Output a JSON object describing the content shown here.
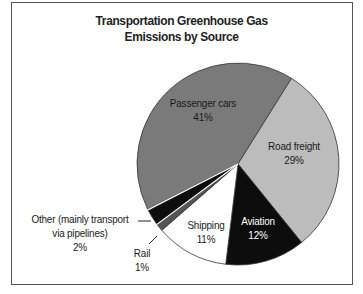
{
  "chart_data": {
    "type": "pie",
    "title": "Transportation Greenhouse Gas Emissions by Source",
    "title_lines": [
      "Transportation Greenhouse Gas",
      "Emissions by Source"
    ],
    "categories": [
      "Passenger cars",
      "Road freight",
      "Aviation",
      "Shipping",
      "Rail",
      "Other (mainly transport via pipelines)"
    ],
    "values": [
      41,
      29,
      12,
      11,
      1,
      2
    ],
    "unit": "%",
    "legend": "none (direct labels)",
    "slices": [
      {
        "name": "Passenger cars",
        "value": 41,
        "label": "41%",
        "color": "#7a7a7a",
        "start_deg": 243.4,
        "end_deg": 392.0
      },
      {
        "name": "Road freight",
        "value": 29,
        "label": "29%",
        "color": "#bcbcbc",
        "start_deg": 32.0,
        "end_deg": 141.0
      },
      {
        "name": "Aviation",
        "value": 12,
        "label": "12%",
        "color": "#0d0d0d",
        "start_deg": 141.0,
        "end_deg": 187.0
      },
      {
        "name": "Shipping",
        "value": 11,
        "label": "11%",
        "color": "#ffffff",
        "start_deg": 187.0,
        "end_deg": 229.0
      },
      {
        "name": "Rail",
        "value": 1,
        "label": "1%",
        "color": "#555555",
        "start_deg": 229.0,
        "end_deg": 233.0
      },
      {
        "name": "Other (mainly transport via pipelines)",
        "value": 2,
        "label": "2%",
        "color": "#0d0d0d",
        "start_deg": 233.6,
        "end_deg": 242.6
      }
    ]
  },
  "labels": {
    "passenger": {
      "line1": "Passenger cars",
      "line2": "41%"
    },
    "road": {
      "line1": "Road freight",
      "line2": "29%"
    },
    "aviation": {
      "line1": "Aviation",
      "line2": "12%"
    },
    "shipping": {
      "line1": "Shipping",
      "line2": "11%"
    },
    "rail": {
      "line1": "Rail",
      "line2": "1%"
    },
    "other": {
      "line1": "Other (mainly transport",
      "line2": "via pipelines)",
      "line3": "2%"
    }
  }
}
